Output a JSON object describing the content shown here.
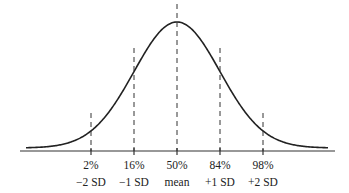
{
  "chart_data": {
    "type": "line",
    "title": "",
    "subtitle": "",
    "xlabel": "",
    "ylabel": "",
    "grid": false,
    "legend": null,
    "x_range_sd": [
      -3.5,
      3.5
    ],
    "curve": "standard-normal-pdf",
    "markers": [
      {
        "sd": -2,
        "percent_label": "2%",
        "sd_label": "−2 SD"
      },
      {
        "sd": -1,
        "percent_label": "16%",
        "sd_label": "−1 SD"
      },
      {
        "sd": 0,
        "percent_label": "50%",
        "sd_label": "mean"
      },
      {
        "sd": 1,
        "percent_label": "84%",
        "sd_label": "+1 SD"
      },
      {
        "sd": 2,
        "percent_label": "98%",
        "sd_label": "+2 SD"
      }
    ],
    "colors": {
      "curve": "#222222",
      "markers": "#333333",
      "axis": "#333333"
    }
  },
  "labels": {
    "percents": [
      "2%",
      "16%",
      "50%",
      "84%",
      "98%"
    ],
    "sds": [
      "−2 SD",
      "−1 SD",
      "mean",
      "+1 SD",
      "+2 SD"
    ]
  }
}
